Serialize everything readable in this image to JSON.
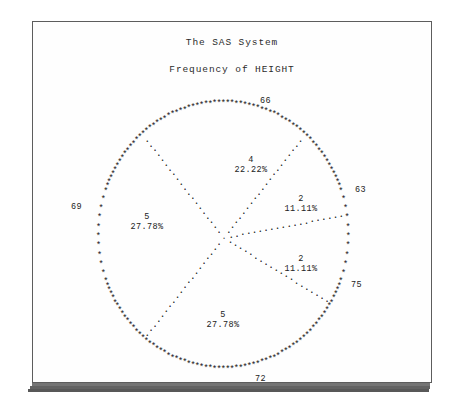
{
  "page": {
    "title_main": "The SAS System",
    "title_sub": "Frequency of HEIGHT"
  },
  "chart_data": {
    "type": "pie",
    "title": "The SAS System",
    "subtitle": "Frequency of HEIGHT",
    "variable": "HEIGHT",
    "render_style": "line-printer-ascii",
    "rim_char": "*",
    "separator_char": ".",
    "total": 18,
    "legend_position": "on-slice",
    "grid": false,
    "categories": [
      "66",
      "63",
      "75",
      "72",
      "69",
      "69b"
    ],
    "values": [
      4,
      2,
      2,
      5,
      5,
      0
    ],
    "slices": [
      {
        "tick": "66",
        "freq": "4",
        "percent": "22.22%",
        "value": 4,
        "start_angle": 50,
        "end_angle": 130,
        "tick_x": 227,
        "tick_y": 74,
        "label_x": 218,
        "label_y": 133
      },
      {
        "tick": "63",
        "freq": "2",
        "percent": "11.11%",
        "value": 2,
        "start_angle": 10,
        "end_angle": 50,
        "tick_x": 322,
        "tick_y": 163,
        "label_x": 268,
        "label_y": 172
      },
      {
        "tick": "75",
        "freq": "2",
        "percent": "11.11%",
        "value": 2,
        "start_angle": -30,
        "end_angle": 10,
        "tick_x": 318,
        "tick_y": 258,
        "label_x": 268,
        "label_y": 232
      },
      {
        "tick": "72",
        "freq": "5",
        "percent": "27.78%",
        "value": 5,
        "start_angle": -130,
        "end_angle": -30,
        "tick_x": 222,
        "tick_y": 352,
        "label_x": 190,
        "label_y": 288
      },
      {
        "tick": "69",
        "freq": "5",
        "percent": "27.78%",
        "value": 5,
        "start_angle": 130,
        "end_angle": 230,
        "tick_x": 38,
        "tick_y": 180,
        "label_x": 114,
        "label_y": 190
      }
    ],
    "tick_labels": [
      "63",
      "66",
      "69",
      "72",
      "75"
    ],
    "slice_freqs": [
      "4",
      "2",
      "2",
      "5",
      "5"
    ],
    "slice_percents": [
      "22.22%",
      "11.11%",
      "11.11%",
      "27.78%",
      "27.78%"
    ]
  }
}
